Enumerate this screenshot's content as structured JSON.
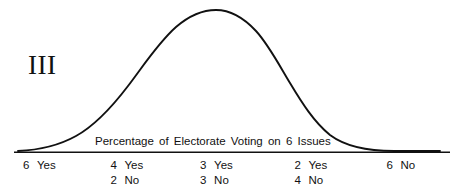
{
  "figure": {
    "numeral": "III",
    "axis_caption": "Percentage of Electorate Voting on 6 Issues",
    "line_color": "#111111",
    "axis_color": "#111111",
    "background_color": "#ffffff"
  },
  "ticks": [
    {
      "position_pct": 5.0,
      "lines": [
        {
          "count": "6",
          "word": "Yes"
        }
      ]
    },
    {
      "position_pct": 24.0,
      "lines": [
        {
          "count": "4",
          "word": "Yes"
        },
        {
          "count": "2",
          "word": "No"
        }
      ]
    },
    {
      "position_pct": 43.5,
      "lines": [
        {
          "count": "3",
          "word": "Yes"
        },
        {
          "count": "3",
          "word": "No"
        }
      ]
    },
    {
      "position_pct": 64.0,
      "lines": [
        {
          "count": "2",
          "word": "Yes"
        },
        {
          "count": "4",
          "word": "No"
        }
      ]
    },
    {
      "position_pct": 84.0,
      "lines": [
        {
          "count": "6",
          "word": "No"
        }
      ]
    }
  ],
  "chart_data": {
    "type": "line",
    "title": "",
    "subtitle": "",
    "xlabel": "Percentage of Electorate Voting on 6 Issues",
    "ylabel": "",
    "grid": false,
    "legend": "none",
    "annotations": [
      "III"
    ],
    "xtick_labels": [
      "6 Yes",
      "4 Yes / 2 No",
      "3 Yes / 3 No",
      "2 Yes / 4 No",
      "6 No"
    ],
    "xtick_positions": [
      0,
      1,
      2,
      3,
      4
    ],
    "x": [
      0,
      0.25,
      0.5,
      0.75,
      1,
      1.25,
      1.5,
      1.75,
      2,
      2.25,
      2.5,
      2.75,
      3,
      3.25,
      3.5,
      3.75,
      4
    ],
    "values": [
      0.0,
      0.02,
      0.06,
      0.14,
      0.3,
      0.52,
      0.75,
      0.93,
      1.0,
      0.95,
      0.78,
      0.55,
      0.33,
      0.17,
      0.07,
      0.02,
      0.0
    ],
    "ylim": [
      0,
      1.05
    ]
  }
}
